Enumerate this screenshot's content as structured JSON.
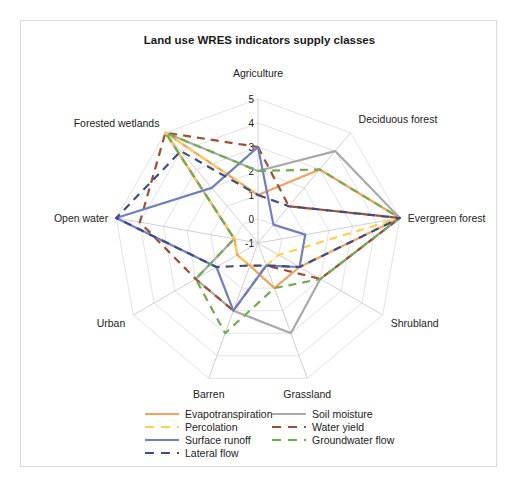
{
  "chart_data": {
    "type": "radar",
    "title": "Land use WRES indicators supply classes",
    "categories": [
      "Agriculture",
      "Deciduous forest",
      "Evergreen forest",
      "Shrubland",
      "Grassland",
      "Barren",
      "Urban",
      "Open water",
      "Forested wetlands"
    ],
    "rlim": [
      -1,
      5
    ],
    "ticks": [
      "-1",
      "0",
      "1",
      "2",
      "3",
      "4",
      "5"
    ],
    "grid": true,
    "legend_position": "bottom",
    "series": [
      {
        "name": "Evapotranspiration",
        "color": "#F4A15D",
        "dash": "solid",
        "values": [
          1,
          3,
          5,
          1,
          1,
          0,
          0,
          0,
          5
        ]
      },
      {
        "name": "Soil moisture",
        "color": "#A9A9A9",
        "dash": "solid",
        "values": [
          2,
          4,
          5,
          2,
          3,
          2,
          2,
          0,
          5
        ]
      },
      {
        "name": "Percolation",
        "color": "#FFD04A",
        "dash": "dashed",
        "values": [
          1,
          1,
          5,
          0,
          0,
          0,
          0,
          0,
          5
        ]
      },
      {
        "name": "Water yield",
        "color": "#9C4F34",
        "dash": "dashed",
        "values": [
          3,
          1,
          5,
          2,
          0,
          2,
          2,
          4,
          5
        ]
      },
      {
        "name": "Surface runoff",
        "color": "#6F7FC2",
        "dash": "solid",
        "values": [
          3,
          0,
          1,
          1,
          0,
          2,
          1,
          5,
          2
        ]
      },
      {
        "name": "Groundwater flow",
        "color": "#72AC4D",
        "dash": "dashed",
        "values": [
          2,
          3,
          5,
          2,
          1,
          3,
          2,
          0,
          5
        ]
      },
      {
        "name": "Lateral flow",
        "color": "#3E4C8C",
        "dash": "dashed",
        "values": [
          1,
          1,
          5,
          1,
          0,
          0,
          1,
          5,
          4
        ]
      }
    ]
  },
  "legend": {
    "items": [
      {
        "label": "Evapotranspiration"
      },
      {
        "label": "Soil moisture"
      },
      {
        "label": "Percolation"
      },
      {
        "label": "Water yield"
      },
      {
        "label": "Surface runoff"
      },
      {
        "label": "Groundwater flow"
      },
      {
        "label": "Lateral flow"
      }
    ]
  }
}
